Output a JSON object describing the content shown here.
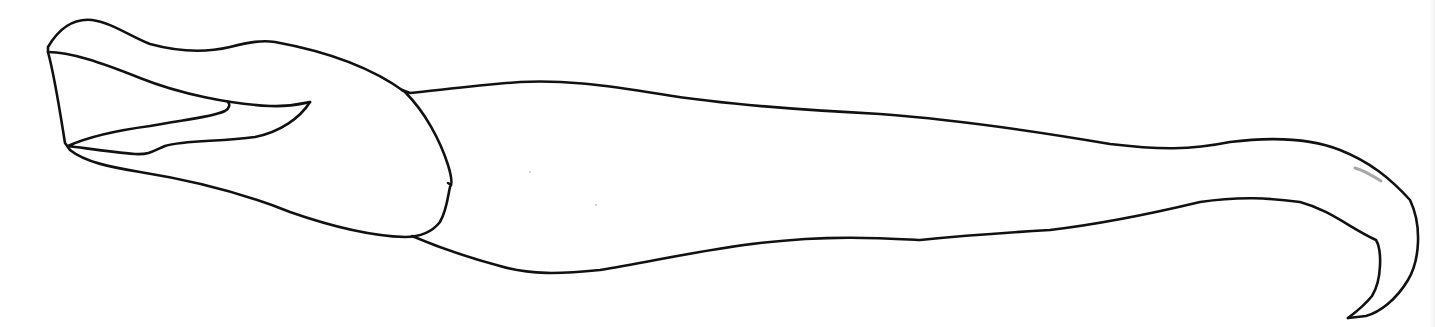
{
  "figure": {
    "stroke_color": "#111111",
    "stroke_width": 2.6,
    "pencil_mark_color": "#a8a8a8",
    "background_color": "#ffffff",
    "parts": [
      "apical-lobe",
      "inner-lobe",
      "shaft",
      "hooked-tip"
    ]
  }
}
